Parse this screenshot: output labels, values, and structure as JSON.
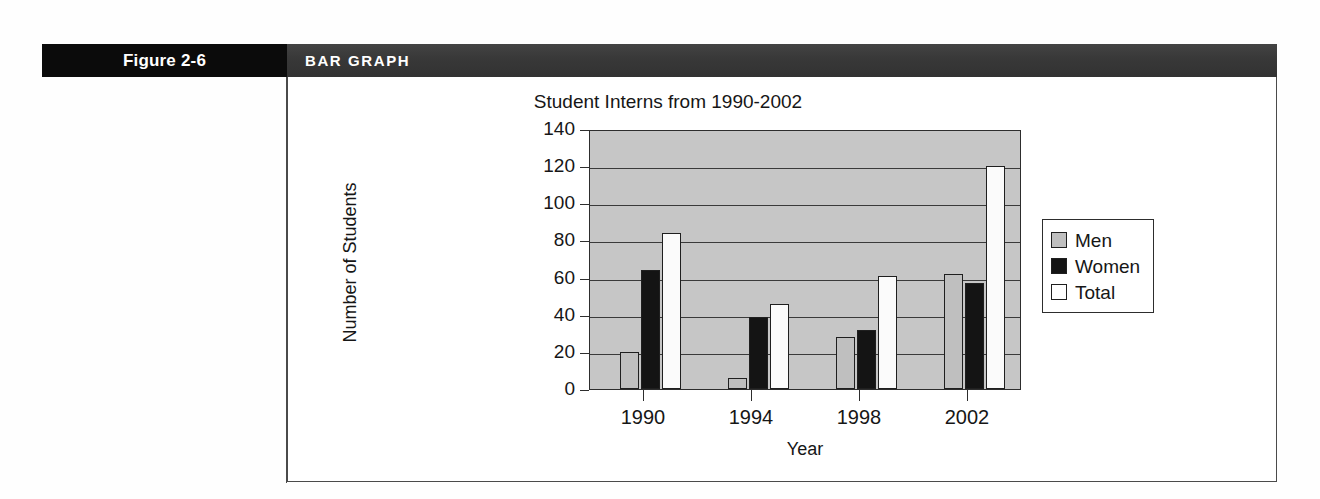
{
  "figure": {
    "number_label": "Figure 2-6",
    "type_label": "BAR GRAPH"
  },
  "chart_data": {
    "type": "bar",
    "title": "Student Interns from 1990-2002",
    "xlabel": "Year",
    "ylabel": "Number of Students",
    "categories": [
      "1990",
      "1994",
      "1998",
      "2002"
    ],
    "series": [
      {
        "name": "Men",
        "color": "#bfbfbf",
        "values": [
          20,
          6,
          28,
          62
        ]
      },
      {
        "name": "Women",
        "color": "#141414",
        "values": [
          64,
          39,
          32,
          57
        ]
      },
      {
        "name": "Total",
        "color": "#ffffff",
        "values": [
          84,
          46,
          61,
          120
        ]
      }
    ],
    "ylim": [
      0,
      140
    ],
    "yticks": [
      "0",
      "20",
      "40",
      "60",
      "80",
      "100",
      "120",
      "140"
    ],
    "grid": true,
    "legend_position": "right",
    "plot_background": "#c6c6c6"
  }
}
